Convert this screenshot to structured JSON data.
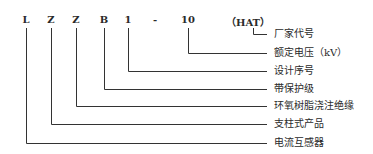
{
  "code_parts": [
    {
      "text": "L",
      "x": 26
    },
    {
      "text": "Z",
      "x": 51
    },
    {
      "text": "Z",
      "x": 76
    },
    {
      "text": "B",
      "x": 104
    },
    {
      "text": "1",
      "x": 128
    },
    {
      "text": "-",
      "x": 155
    },
    {
      "text": "10",
      "x": 188
    },
    {
      "text": "（HAT）",
      "x": 248
    }
  ],
  "labels": [
    {
      "text": "厂家代号",
      "y": 34
    },
    {
      "text": "额定电压（kV）",
      "y": 53
    },
    {
      "text": "设计序号",
      "y": 71
    },
    {
      "text": "带保护级",
      "y": 89
    },
    {
      "text": "环氧树脂浇注绝缘",
      "y": 106
    },
    {
      "text": "支柱式产品",
      "y": 124
    },
    {
      "text": "电流互感器",
      "y": 143
    }
  ]
}
